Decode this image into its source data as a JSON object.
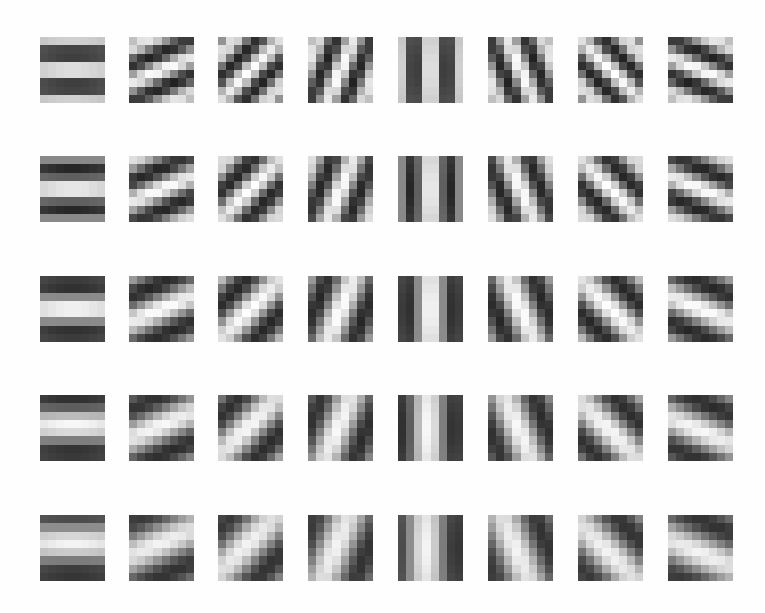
{
  "figure": {
    "title": "",
    "rows": 5,
    "cols": 8,
    "grid_size": 8,
    "column_x": [
      40,
      129,
      218,
      308,
      398,
      488,
      578,
      668
    ],
    "row_y": [
      37,
      156,
      276,
      395,
      515
    ],
    "patch_width": 65,
    "patch_height": 66,
    "colors": {
      "background": "#fefefe",
      "dark": "#1a1a1a",
      "light": "#ffffff"
    },
    "orientations_deg": [
      0,
      22.5,
      45,
      67.5,
      90,
      112.5,
      135,
      157.5
    ],
    "row_params": [
      {
        "freq": 2.0,
        "phase": 0.0,
        "sigma": 3.6,
        "contrast": 1.0
      },
      {
        "freq": 1.7,
        "phase": 0.0,
        "sigma": 3.6,
        "contrast": 1.0
      },
      {
        "freq": 1.35,
        "phase": 0.0,
        "sigma": 3.8,
        "contrast": 1.0
      },
      {
        "freq": 1.2,
        "phase": 0.3,
        "sigma": 4.0,
        "contrast": 0.95
      },
      {
        "freq": 1.05,
        "phase": 0.5,
        "sigma": 4.2,
        "contrast": 0.9
      }
    ]
  }
}
